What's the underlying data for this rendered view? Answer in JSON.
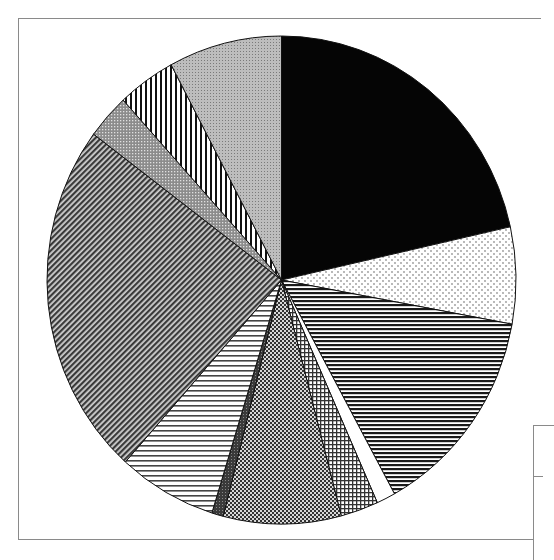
{
  "chart_data": {
    "type": "pie",
    "title": "",
    "start_angle_deg": 0,
    "direction": "clockwise",
    "legend": {
      "visible": "partial (clipped at right edge)",
      "position": "bottom-right",
      "entries": []
    },
    "slices": [
      {
        "pattern": "solid-black",
        "value": 21.5
      },
      {
        "pattern": "sparse-dots",
        "value": 6.4
      },
      {
        "pattern": "horizontal-dense",
        "value": 14.1
      },
      {
        "pattern": "white",
        "value": 1.3
      },
      {
        "pattern": "grid",
        "value": 2.6
      },
      {
        "pattern": "checker-dense",
        "value": 8.1
      },
      {
        "pattern": "dark-fine",
        "value": 0.8
      },
      {
        "pattern": "horizontal-light",
        "value": 6.8
      },
      {
        "pattern": "diagonal-dense",
        "value": 23.6
      },
      {
        "pattern": "grey-dots",
        "value": 3.0
      },
      {
        "pattern": "vertical-stripes",
        "value": 4.0
      },
      {
        "pattern": "light-grey-dots",
        "value": 7.8
      }
    ],
    "labels_visible": false
  },
  "geometry": {
    "cx": 281.5,
    "cy": 280,
    "rx": 234.5,
    "ry": 244
  }
}
